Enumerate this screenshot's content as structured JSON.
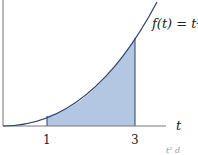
{
  "diagram": {
    "function_label": "f(t) = t²",
    "axis_label": "t",
    "ticks": [
      {
        "label": "1",
        "value": 1
      },
      {
        "label": "3",
        "value": 3
      }
    ],
    "shaded_interval": [
      1,
      3
    ],
    "colors": {
      "fill": "#b3c7e3",
      "curve": "#2a3f6e",
      "axis": "#555555"
    },
    "footer_partial": "t² d"
  }
}
